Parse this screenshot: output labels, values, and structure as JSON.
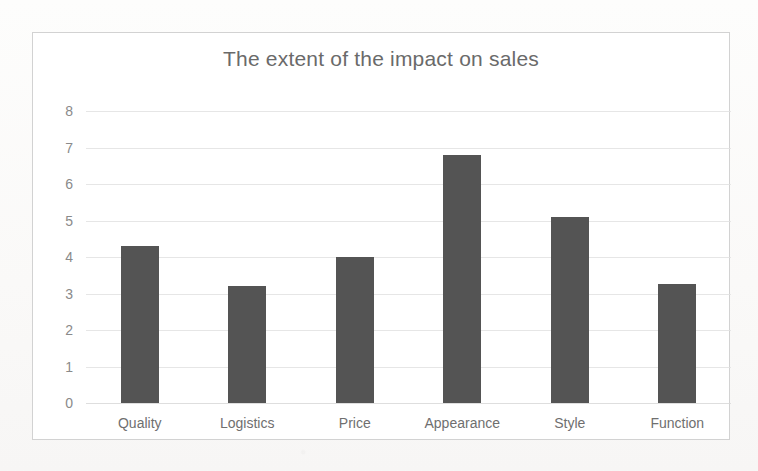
{
  "chart_data": {
    "type": "bar",
    "title": "The extent of the impact on sales",
    "xlabel": "",
    "ylabel": "",
    "categories": [
      "Quality",
      "Logistics",
      "Price",
      "Appearance",
      "Style",
      "Function"
    ],
    "values": [
      4.3,
      3.2,
      4.0,
      6.8,
      5.1,
      3.25
    ],
    "series": [
      {
        "name": "",
        "values": [
          4.3,
          3.2,
          4.0,
          6.8,
          5.1,
          3.25
        ]
      }
    ],
    "ylim": [
      0,
      8
    ],
    "yticks": [
      0,
      1,
      2,
      3,
      4,
      5,
      6,
      7,
      8
    ],
    "ytick_labels": [
      "0",
      "1",
      "2",
      "3",
      "4",
      "5",
      "6",
      "7",
      "8"
    ],
    "grid": true,
    "grid_axis": "y",
    "legend": false,
    "legend_position": "none",
    "bar_color": "#545454",
    "title_color": "#6a6a6a",
    "gridline_color": "#e2e2e2",
    "tick_label_color": "#8a8a8a",
    "plot_background": "#ffffff",
    "frame_border_color": "#d2d2d2"
  }
}
